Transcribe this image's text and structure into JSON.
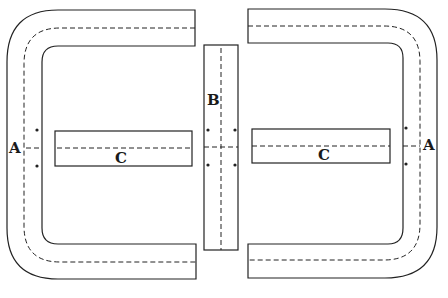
{
  "diagram": {
    "colors": {
      "line": "#222222",
      "background": "#ffffff"
    },
    "labels": {
      "left_a": "A",
      "right_a": "A",
      "center_b": "B",
      "left_c": "C",
      "right_c": "C"
    }
  }
}
